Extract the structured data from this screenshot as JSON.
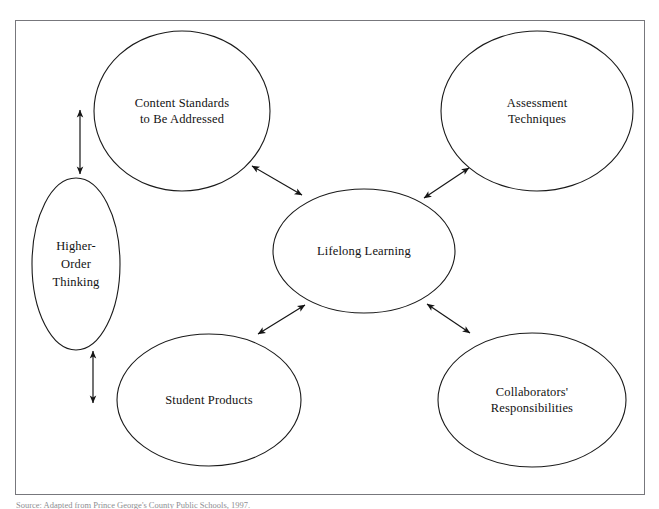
{
  "figure": {
    "frame": {
      "border_color": "#77777c",
      "background": "#ffffff"
    },
    "stroke_color": "#1a1a1a",
    "text_color": "#121212"
  },
  "nodes": [
    {
      "id": "content-standards",
      "label": "Content Standards\nto Be Addressed",
      "cx": 182,
      "cy": 111,
      "rx": 88,
      "ry": 80
    },
    {
      "id": "assessment-techniques",
      "label": "Assessment\nTechniques",
      "cx": 537,
      "cy": 111,
      "rx": 96,
      "ry": 80
    },
    {
      "id": "higher-order-thinking",
      "label": "Higher-\nOrder\nThinking",
      "cx": 76,
      "cy": 264,
      "rx": 44,
      "ry": 86
    },
    {
      "id": "lifelong-learning",
      "label": "Lifelong Learning",
      "cx": 364,
      "cy": 251,
      "rx": 91,
      "ry": 62
    },
    {
      "id": "student-products",
      "label": "Student Products",
      "cx": 209,
      "cy": 400,
      "rx": 92,
      "ry": 66
    },
    {
      "id": "collaborators-responsibilities",
      "label": "Collaborators'\nResponsibilities",
      "cx": 532,
      "cy": 400,
      "rx": 94,
      "ry": 67
    }
  ],
  "connectors": [
    {
      "id": "content-standards-to-lifelong-learning",
      "from": "content-standards",
      "to": "lifelong-learning",
      "style": "double-headed-arrow",
      "x1": 252,
      "y1": 166,
      "x2": 302,
      "y2": 195
    },
    {
      "id": "assessment-techniques-to-lifelong-learning",
      "from": "assessment-techniques",
      "to": "lifelong-learning",
      "style": "double-headed-arrow",
      "x1": 469,
      "y1": 168,
      "x2": 424,
      "y2": 198
    },
    {
      "id": "student-products-to-lifelong-learning",
      "from": "student-products",
      "to": "lifelong-learning",
      "style": "double-headed-arrow",
      "x1": 258,
      "y1": 334,
      "x2": 305,
      "y2": 305
    },
    {
      "id": "collaborators-to-lifelong-learning",
      "from": "collaborators-responsibilities",
      "to": "lifelong-learning",
      "style": "double-headed-arrow",
      "x1": 470,
      "y1": 333,
      "x2": 427,
      "y2": 304
    },
    {
      "id": "content-standards-to-higher-order-thinking",
      "from": "content-standards",
      "to": "higher-order-thinking",
      "style": "double-headed-arrow",
      "x1": 80,
      "y1": 110,
      "x2": 80,
      "y2": 174
    },
    {
      "id": "higher-order-thinking-to-student-products",
      "from": "higher-order-thinking",
      "to": "student-products",
      "style": "double-headed-arrow",
      "x1": 93,
      "y1": 351,
      "x2": 93,
      "y2": 403
    }
  ],
  "caption": {
    "text": "Source: Adapted from Prince George's County Public Schools, 1997.",
    "visible": "clipped"
  }
}
